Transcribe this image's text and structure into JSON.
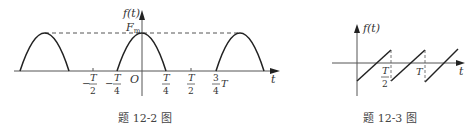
{
  "figures": [
    {
      "caption": "题 12-2 图",
      "y_label": "f(t)",
      "x_label": "t",
      "origin_label": "O",
      "peak_label": "F",
      "peak_label_sub": "m",
      "ticks": [
        {
          "num": "T",
          "den": "2",
          "sign": "−"
        },
        {
          "num": "T",
          "den": "4",
          "sign": "−"
        },
        {
          "num": "T",
          "den": "4",
          "sign": ""
        },
        {
          "num": "T",
          "den": "2",
          "sign": ""
        },
        {
          "num": "3",
          "den": "4",
          "suffix": "T"
        }
      ],
      "description": "Half-wave rectified cosine, period T, peak Fm; nonzero for |t| < T/4"
    },
    {
      "caption": "题 12-3 图",
      "y_label": "f(t)",
      "x_label": "t",
      "ticks": [
        {
          "num": "T",
          "den": "2"
        },
        {
          "label": "T"
        }
      ],
      "description": "Sawtooth wave with period T/2, linear ramp from negative to positive value"
    }
  ],
  "colors": {
    "stroke": "#222222",
    "axis": "#555555",
    "text": "#333333"
  }
}
